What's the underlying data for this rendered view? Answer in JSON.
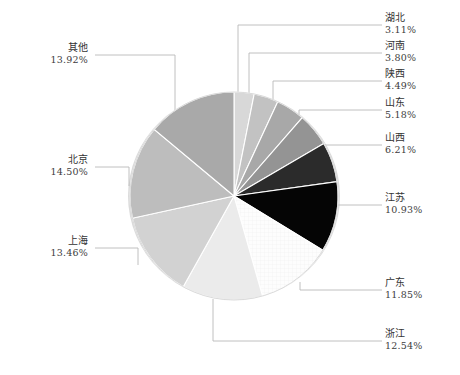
{
  "chart_data": {
    "type": "pie",
    "title": "",
    "subtitle": "",
    "xlabel": "",
    "ylabel": "",
    "legend_position": "none",
    "grid": false,
    "value_unit": "%",
    "start_angle_deg": 0,
    "direction": "clockwise",
    "categories": [
      "湖北",
      "河南",
      "陕西",
      "山东",
      "山西",
      "江苏",
      "广东",
      "浙江",
      "上海",
      "北京",
      "其他"
    ],
    "values": [
      3.11,
      3.8,
      4.49,
      5.18,
      6.21,
      10.93,
      11.85,
      12.54,
      13.46,
      14.5,
      13.92
    ],
    "labels": [
      "3.11%",
      "3.80%",
      "4.49%",
      "5.18%",
      "6.21%",
      "10.93%",
      "11.85%",
      "12.54%",
      "13.46%",
      "14.50%",
      "13.92%"
    ],
    "colors": [
      "#d8d8d8",
      "#c2c2c2",
      "#a8a8a8",
      "#949494",
      "#2b2b2b",
      "#050505",
      "#fbfbfb",
      "#ebebeb",
      "#d2d2d2",
      "#bdbdbd",
      "#a9a9a9"
    ],
    "slices": [
      {
        "name": "湖北",
        "value": 3.11,
        "label": "3.11%",
        "color": "#d8d8d8"
      },
      {
        "name": "河南",
        "value": 3.8,
        "label": "3.80%",
        "color": "#c2c2c2"
      },
      {
        "name": "陕西",
        "value": 4.49,
        "label": "4.49%",
        "color": "#a8a8a8"
      },
      {
        "name": "山东",
        "value": 5.18,
        "label": "5.18%",
        "color": "#949494"
      },
      {
        "name": "山西",
        "value": 6.21,
        "label": "6.21%",
        "color": "#2b2b2b"
      },
      {
        "name": "江苏",
        "value": 10.93,
        "label": "10.93%",
        "color": "#050505"
      },
      {
        "name": "广东",
        "value": 11.85,
        "label": "11.85%",
        "color": "#fbfbfb"
      },
      {
        "name": "浙江",
        "value": 12.54,
        "label": "12.54%",
        "color": "#ebebeb"
      },
      {
        "name": "上海",
        "value": 13.46,
        "label": "13.46%",
        "color": "#d2d2d2"
      },
      {
        "name": "北京",
        "value": 14.5,
        "label": "14.50%",
        "color": "#bdbdbd"
      },
      {
        "name": "其他",
        "value": 13.92,
        "label": "13.92%",
        "color": "#a9a9a9"
      }
    ],
    "total": 99.99
  },
  "labels": {
    "hubei": {
      "name": "湖北",
      "value": "3.11%"
    },
    "henan": {
      "name": "河南",
      "value": "3.80%"
    },
    "shaanxi": {
      "name": "陕西",
      "value": "4.49%"
    },
    "shandong": {
      "name": "山东",
      "value": "5.18%"
    },
    "shanxi": {
      "name": "山西",
      "value": "6.21%"
    },
    "jiangsu": {
      "name": "江苏",
      "value": "10.93%"
    },
    "guangdong": {
      "name": "广东",
      "value": "11.85%"
    },
    "zhejiang": {
      "name": "浙江",
      "value": "12.54%"
    },
    "shanghai": {
      "name": "上海",
      "value": "13.46%"
    },
    "beijing": {
      "name": "北京",
      "value": "14.50%"
    },
    "other": {
      "name": "其他",
      "value": "13.92%"
    }
  },
  "style": {
    "slice_border": "#ffffff",
    "leader_line": "#b9b9b9",
    "background": "#ffffff"
  }
}
